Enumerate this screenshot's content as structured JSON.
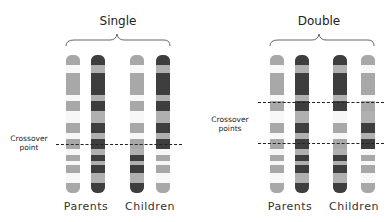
{
  "colors": {
    "light": "#ececec",
    "mid": "#a8a8a8",
    "dark": "#3e3e3e",
    "darkmid": "#6a6a6a"
  },
  "panels": [
    {
      "title": "Single",
      "crossover_label_line1": "Crossover",
      "crossover_label_line2": "point",
      "group_labels": {
        "parents": "Parents",
        "children": "Children"
      },
      "crossover_y": [
        144
      ]
    },
    {
      "title": "Double",
      "crossover_label_line1": "Crossover",
      "crossover_label_line2": "points",
      "group_labels": {
        "parents": "Parents",
        "children": "Children"
      },
      "crossover_y": [
        102,
        143
      ]
    }
  ]
}
